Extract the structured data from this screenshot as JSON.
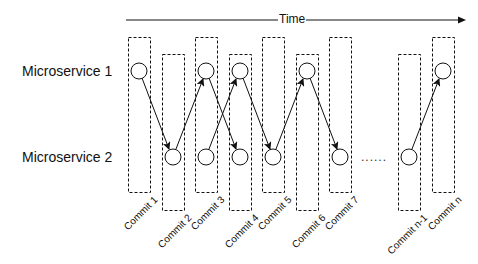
{
  "diagram": {
    "time_axis": {
      "label": "Time"
    },
    "rows": [
      {
        "label": "Microservice 1"
      },
      {
        "label": "Microservice 2"
      }
    ],
    "commits": [
      {
        "label": "Commit 1"
      },
      {
        "label": "Commit 2"
      },
      {
        "label": "Commit 3"
      },
      {
        "label": "Commit 4"
      },
      {
        "label": "Commit 5"
      },
      {
        "label": "Commit 6"
      },
      {
        "label": "Commit 7"
      },
      {
        "label": "Commit n-1"
      },
      {
        "label": "Commit n"
      }
    ],
    "ellipsis": "......",
    "edges": [
      {
        "from": "Commit 1 / Microservice 1",
        "to": "Commit 2 / Microservice 2"
      },
      {
        "from": "Commit 2 / Microservice 2",
        "to": "Commit 3 / Microservice 1"
      },
      {
        "from": "Commit 3 / Microservice 1",
        "to": "Commit 4 / Microservice 2"
      },
      {
        "from": "Commit 3 / Microservice 2",
        "to": "Commit 4 / Microservice 1"
      },
      {
        "from": "Commit 4 / Microservice 1",
        "to": "Commit 5 / Microservice 2"
      },
      {
        "from": "Commit 5 / Microservice 2",
        "to": "Commit 6 / Microservice 1"
      },
      {
        "from": "Commit 6 / Microservice 1",
        "to": "Commit 7 / Microservice 2"
      },
      {
        "from": "Commit n-1 / Microservice 2",
        "to": "Commit n / Microservice 1"
      }
    ]
  }
}
